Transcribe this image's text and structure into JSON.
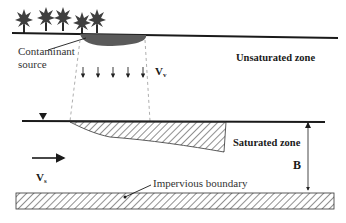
{
  "diagram": {
    "labels": {
      "contaminant_source": [
        "Contaminant",
        "source"
      ],
      "unsaturated_zone": "Unsaturated zone",
      "saturated_zone": "Saturated zone",
      "vertical_velocity": {
        "base": "V",
        "sub": "v"
      },
      "seepage_velocity": {
        "base": "V",
        "sub": "s"
      },
      "aquifer_thickness": "B",
      "impervious_boundary": "Impervious boundary"
    },
    "elements": {
      "trees": 5,
      "infiltration_arrows": 5,
      "water_table_marker": "inverted-triangle"
    },
    "colors": {
      "ink": "#1a1a1a",
      "contaminant_fill": "#555555",
      "hatch": "#333333",
      "dashed": "#999999",
      "tree": "#3a3a3a"
    }
  }
}
